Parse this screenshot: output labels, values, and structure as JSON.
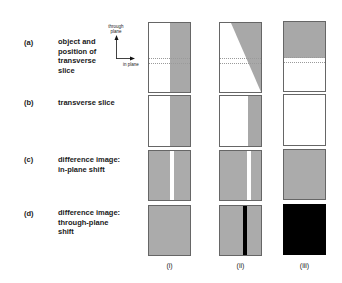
{
  "rows": [
    {
      "id": "(a)",
      "label": "object and position of transverse slice"
    },
    {
      "id": "(b)",
      "label": "transverse slice"
    },
    {
      "id": "(c)",
      "label": "difference image: in-plane shift"
    },
    {
      "id": "(d)",
      "label": "difference image: through-plane shift"
    }
  ],
  "row_lines": {
    "a": [
      "object and",
      "position of",
      "transverse",
      "slice"
    ],
    "b": [
      "transverse slice"
    ],
    "c": [
      "difference image:",
      "in-plane shift"
    ],
    "d": [
      "difference image:",
      "through-plane",
      "shift"
    ]
  },
  "axes": {
    "vertical_label_1": "through",
    "vertical_label_2": "plane",
    "horizontal_label": "in plane"
  },
  "columns": [
    {
      "label": "(i)"
    },
    {
      "label": "(ii)"
    },
    {
      "label": "(iii)"
    }
  ],
  "colors": {
    "object_gray": "#a8a8a8",
    "difference_gray": "#ababab",
    "positive_stripe": "#ffffff",
    "negative": "#000000",
    "border": "#666666",
    "slice_lines": "#9a9a9a"
  }
}
